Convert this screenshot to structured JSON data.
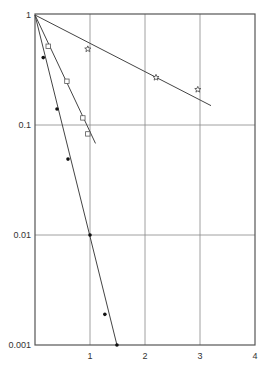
{
  "chart_data": {
    "type": "scatter",
    "title": "",
    "xlabel": "",
    "ylabel": "",
    "xscale": "linear",
    "yscale": "log",
    "xlim": [
      0,
      4
    ],
    "ylim": [
      0.001,
      1
    ],
    "grid": true,
    "legend": null,
    "x_ticks": [
      "1",
      "2",
      "3",
      "4"
    ],
    "x_tick_values": [
      1,
      2,
      3,
      4
    ],
    "y_ticks": [
      "1",
      "0.1",
      "0.01",
      "0.001"
    ],
    "y_tick_values": [
      1,
      0.1,
      0.01,
      0.001
    ],
    "series": [
      {
        "name": "filled circles",
        "marker": "filled-circle",
        "points": [
          [
            0.15,
            0.41
          ],
          [
            0.4,
            0.14
          ],
          [
            0.6,
            0.049
          ],
          [
            1.0,
            0.01
          ],
          [
            1.27,
            0.0019
          ],
          [
            1.49,
            0.001
          ]
        ],
        "fit_line": [
          [
            0,
            1
          ],
          [
            1.49,
            0.001
          ]
        ]
      },
      {
        "name": "open squares",
        "marker": "open-square",
        "points": [
          [
            0.24,
            0.52
          ],
          [
            0.58,
            0.25
          ],
          [
            0.87,
            0.116
          ],
          [
            0.96,
            0.083
          ]
        ],
        "fit_line": [
          [
            0,
            1
          ],
          [
            1.1,
            0.068
          ]
        ]
      },
      {
        "name": "stars",
        "marker": "star",
        "points": [
          [
            0.96,
            0.49
          ],
          [
            2.2,
            0.27
          ],
          [
            2.96,
            0.21
          ]
        ],
        "fit_line": [
          [
            0,
            1
          ],
          [
            3.2,
            0.15
          ]
        ]
      }
    ]
  }
}
